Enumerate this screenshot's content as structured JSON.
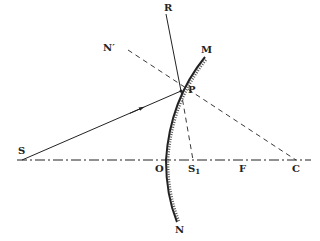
{
  "diagram": {
    "type": "optics-concave-mirror-reflection",
    "labels": {
      "R": "R",
      "M": "M",
      "N_prime": "N′",
      "P": "P",
      "S": "S",
      "O": "O",
      "S1_main": "S",
      "S1_sub": "1",
      "F": "F",
      "C": "C",
      "N": "N"
    },
    "points": {
      "S": [
        22,
        160
      ],
      "O": [
        166,
        160
      ],
      "S1": [
        193,
        160
      ],
      "F": [
        243,
        160
      ],
      "C": [
        296,
        160
      ],
      "P": [
        181,
        91
      ],
      "R": [
        166,
        14
      ],
      "M": [
        205,
        57
      ],
      "N_end": [
        177,
        222
      ],
      "N_prime": [
        128,
        47
      ]
    },
    "colors": {
      "line": "#222222",
      "background": "#ffffff"
    }
  }
}
